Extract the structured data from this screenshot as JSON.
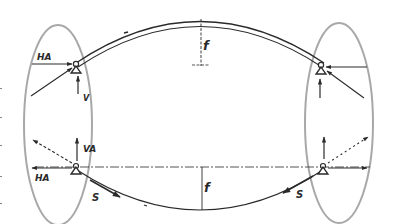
{
  "diagram": {
    "title": "",
    "colors": {
      "ink": "#2a2a2a",
      "ellipse": "#a8a8a8",
      "background": "#ffffff"
    },
    "top_structure": {
      "type": "arch",
      "rise_label": "f",
      "left_support": {
        "horizontal_reaction_label": "HA",
        "vertical_reaction_label": "V",
        "horizontal_reaction_direction": "into support (rightward)",
        "vertical_reaction_direction": "upward",
        "thrust_direction": "inclined toward support"
      },
      "right_support": {
        "horizontal_reaction_direction": "into support (leftward)",
        "vertical_reaction_direction": "upward",
        "thrust_direction": "inclined toward support"
      }
    },
    "bottom_structure": {
      "type": "cable",
      "sag_label": "f",
      "cable_force_label": "S",
      "left_support": {
        "horizontal_reaction_label": "HA",
        "vertical_reaction_label": "VA",
        "horizontal_reaction_direction": "outward (leftward)",
        "vertical_reaction_direction": "upward",
        "cable_force_label": "S"
      },
      "right_support": {
        "horizontal_reaction_direction": "outward (rightward)",
        "vertical_reaction_direction": "upward",
        "cable_force_label": "S"
      }
    },
    "labels": {
      "top_left_h": "HA",
      "top_left_v": "V",
      "top_rise": "f",
      "bottom_left_h": "HA",
      "bottom_left_v": "VA",
      "bottom_sag": "f",
      "bottom_left_s": "S",
      "bottom_right_s": "S"
    }
  }
}
